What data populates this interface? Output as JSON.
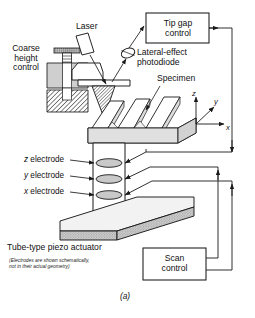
{
  "figure": {
    "caption": "(a)"
  },
  "labels": {
    "laser": "Laser",
    "coarse_height_control": "Coarse\nheight\ncontrol",
    "lateral_effect_photodiode": "Lateral-effect\nphotodiode",
    "specimen": "Specimen",
    "z_electrode": "z electrode",
    "y_electrode": "y electrode",
    "x_electrode": "x electrode",
    "tube_piezo_actuator": "Tube-type piezo actuator",
    "electrode_note": "(Electrodes are shown schematically,\nnot in their actual geometry)"
  },
  "boxes": {
    "tip_gap_control": "Tip gap\ncontrol",
    "scan_control": "Scan\ncontrol"
  },
  "axes": {
    "z": "z",
    "y": "y",
    "x": "x"
  },
  "colors": {
    "stroke": "#1a1a1a",
    "specimen_fill": "#e3e3e3",
    "electrode_fill": "#c9c9c9",
    "base_fill": "#efefef",
    "base_edge_fill": "#8f8f8f",
    "block_fill": "#d8d8d8",
    "background": "#ffffff"
  }
}
